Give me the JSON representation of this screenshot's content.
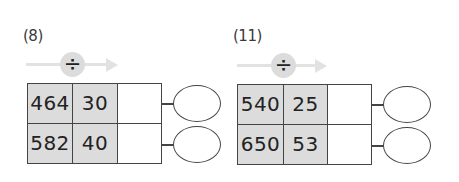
{
  "problems": [
    {
      "label": "(8)",
      "operator_symbol": "÷",
      "operator_icon": "division-icon",
      "rows": [
        {
          "dividend": "464",
          "divisor": "30",
          "answer": "",
          "remainder": ""
        },
        {
          "dividend": "582",
          "divisor": "40",
          "answer": "",
          "remainder": ""
        }
      ]
    },
    {
      "label": "(11)",
      "operator_symbol": "÷",
      "operator_icon": "division-icon",
      "rows": [
        {
          "dividend": "540",
          "divisor": "25",
          "answer": "",
          "remainder": ""
        },
        {
          "dividend": "650",
          "divisor": "53",
          "answer": "",
          "remainder": ""
        }
      ]
    }
  ],
  "colors": {
    "given_cell_fill": "#dcdcdc",
    "arrow": "#e2e2e2",
    "operator_circle": "#dcdcdc",
    "border": "#444444"
  }
}
